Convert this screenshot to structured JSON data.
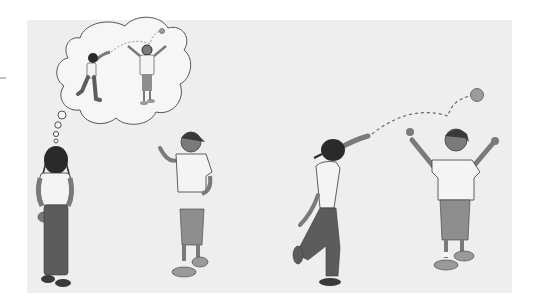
{
  "illustration": {
    "description": "Grayscale illustration of children playing catch",
    "colors": {
      "page": "#ffffff",
      "panel": "#eeeeee",
      "outline": "#3a3a3a",
      "shirt": "#f4f4f4",
      "skin": "#7a7a7a",
      "hair": "#2a2a2a",
      "pants_dark": "#5c5c5c",
      "shorts": "#8e8e8e",
      "shoe": "#9a9a9a",
      "ball": "#9c9c9c",
      "bubble": "#f6f6f6"
    },
    "scenes": [
      {
        "name": "left-scene",
        "figures": [
          "girl-thinking",
          "boy-talking"
        ],
        "thought_bubble": "girl-throws-ball-to-boy"
      },
      {
        "name": "right-scene",
        "figures": [
          "girl-throwing",
          "boy-catching"
        ],
        "ball": "ball-in-air"
      }
    ]
  }
}
